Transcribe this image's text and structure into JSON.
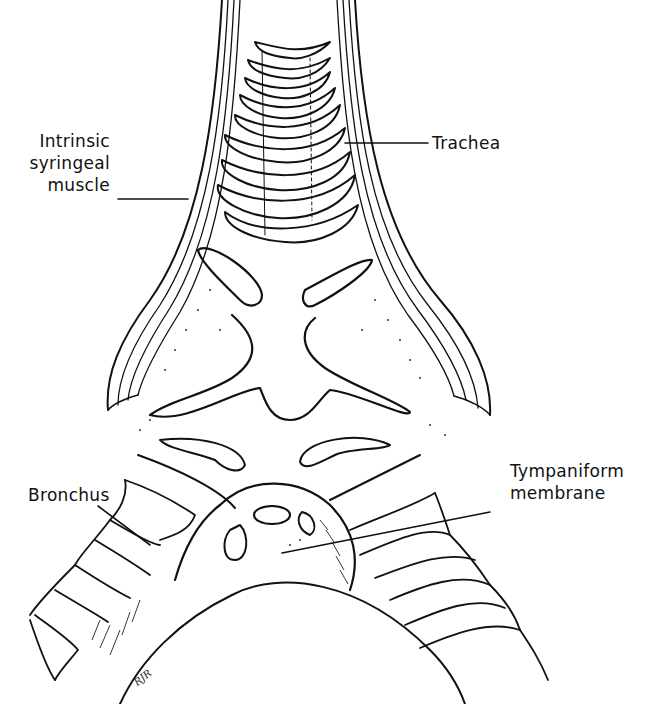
{
  "figure": {
    "labels": {
      "intrinsic_muscle": [
        "Intrinsic",
        "syringeal",
        "muscle"
      ],
      "trachea": "Trachea",
      "bronchus": "Bronchus",
      "tympaniform": [
        "Tympaniform",
        "membrane"
      ]
    },
    "signature": "RJR",
    "colors": {
      "ink": "#111111",
      "background": "#ffffff",
      "stipple": "#333333"
    }
  }
}
